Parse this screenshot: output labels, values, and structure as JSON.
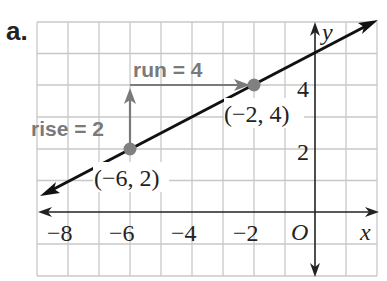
{
  "part_label": "a.",
  "graph": {
    "x_axis_label": "x",
    "y_axis_label": "y",
    "origin_label": "O",
    "x_ticks": [
      {
        "value": -8,
        "label": "−8"
      },
      {
        "value": -6,
        "label": "−6"
      },
      {
        "value": -4,
        "label": "−4"
      },
      {
        "value": -2,
        "label": "−2"
      }
    ],
    "y_ticks": [
      {
        "value": 2,
        "label": "2"
      },
      {
        "value": 4,
        "label": "4"
      }
    ],
    "x_range": [
      -9,
      2
    ],
    "y_range": [
      -2,
      6
    ],
    "points": [
      {
        "x": -6,
        "y": 2,
        "label": "(−6, 2)"
      },
      {
        "x": -2,
        "y": 4,
        "label": "(−2, 4)"
      }
    ],
    "line": {
      "slope": 0.5,
      "intercept": 5,
      "color": "#111111"
    },
    "rise_label": "rise = 2",
    "run_label": "run = 4",
    "annotation_color": "#7a7a7a",
    "grid_color": "#c8c8c8",
    "point_color": "#808080"
  }
}
